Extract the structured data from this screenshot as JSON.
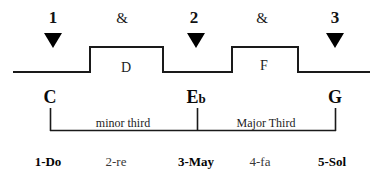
{
  "figure": {
    "width": 381,
    "height": 177,
    "background": "#ffffff",
    "ink": "#000000"
  },
  "beat_row": {
    "items": [
      {
        "label": "1",
        "kind": "number",
        "x": 53
      },
      {
        "label": "&",
        "kind": "and",
        "x": 122
      },
      {
        "label": "2",
        "kind": "number",
        "x": 194
      },
      {
        "label": "&",
        "kind": "and",
        "x": 262
      },
      {
        "label": "3",
        "kind": "number",
        "x": 335
      }
    ]
  },
  "downbeat_markers": {
    "name": "downbeat-arrow",
    "glyph": "▼",
    "positions": [
      53,
      196,
      335
    ]
  },
  "wave": {
    "description": "square-wave pitch contour",
    "baseline_y": 72,
    "peak_y": 47,
    "stroke": "#1a1a1a",
    "stroke_width": 2,
    "points": "13,72 90,72 90,47 163,47 163,72 232,72 232,47 298,47 298,72 370,72",
    "notes": [
      {
        "label": "D",
        "x": 126,
        "y": 68
      },
      {
        "label": "F",
        "x": 264,
        "y": 66
      }
    ]
  },
  "scale_letters": [
    {
      "text": "C",
      "flat": "",
      "x": 50
    },
    {
      "text": "E",
      "flat": "b",
      "x": 196
    },
    {
      "text": "G",
      "flat": "",
      "x": 335
    }
  ],
  "bracket": {
    "stroke": "#1a1a1a",
    "stroke_width": 1.6,
    "top_y": 108,
    "bottom_y": 131,
    "ticks": [
      50,
      197,
      335
    ],
    "intervals": [
      {
        "label": "minor third",
        "x": 123,
        "y": 118
      },
      {
        "label": "Major Third",
        "x": 266,
        "y": 118
      }
    ]
  },
  "solfege_row": {
    "items": [
      {
        "label": "1-Do",
        "emphasis": "strong",
        "x": 48
      },
      {
        "label": "2-re",
        "emphasis": "weak",
        "x": 116
      },
      {
        "label": "3-May",
        "emphasis": "strong",
        "x": 196
      },
      {
        "label": "4-fa",
        "emphasis": "weak",
        "x": 260
      },
      {
        "label": "5-Sol",
        "emphasis": "strong",
        "x": 332
      }
    ]
  }
}
